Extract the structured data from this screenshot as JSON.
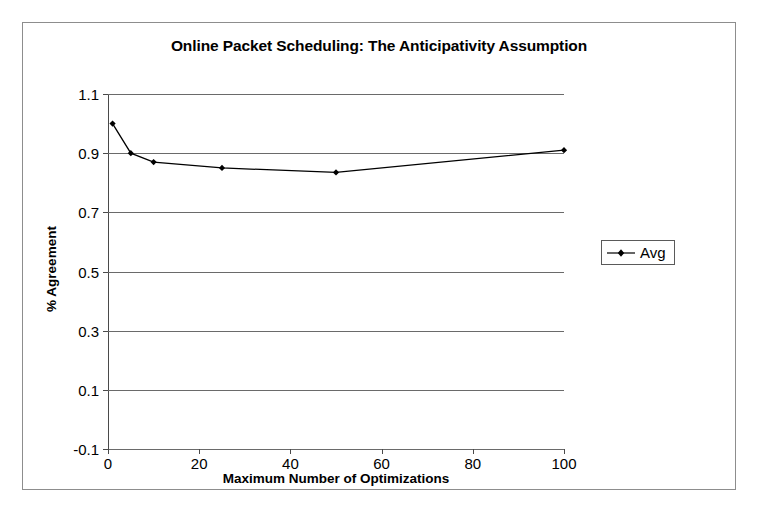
{
  "chart_data": {
    "type": "line",
    "title": "Online Packet Scheduling: The Anticipativity Assumption",
    "xlabel": "Maximum Number of Optimizations",
    "ylabel": "% Agreement",
    "xlim": [
      0,
      100
    ],
    "ylim": [
      -0.1,
      1.1
    ],
    "xticks": [
      0,
      20,
      40,
      60,
      80,
      100
    ],
    "xtick_labels": [
      "0",
      "20",
      "40",
      "60",
      "80",
      "100"
    ],
    "yticks": [
      -0.1,
      0.1,
      0.3,
      0.5,
      0.7,
      0.9,
      1.1
    ],
    "ytick_labels": [
      "-0.1",
      "0.1",
      "0.3",
      "0.5",
      "0.7",
      "0.9",
      "1.1"
    ],
    "grid": "horizontal",
    "legend_position": "right",
    "series": [
      {
        "name": "Avg",
        "marker": "diamond",
        "color": "#000000",
        "x": [
          1,
          5,
          10,
          25,
          50,
          100
        ],
        "values": [
          1.0,
          0.9,
          0.87,
          0.85,
          0.835,
          0.91
        ]
      }
    ]
  },
  "legend": {
    "entries": [
      {
        "label": "Avg"
      }
    ]
  }
}
